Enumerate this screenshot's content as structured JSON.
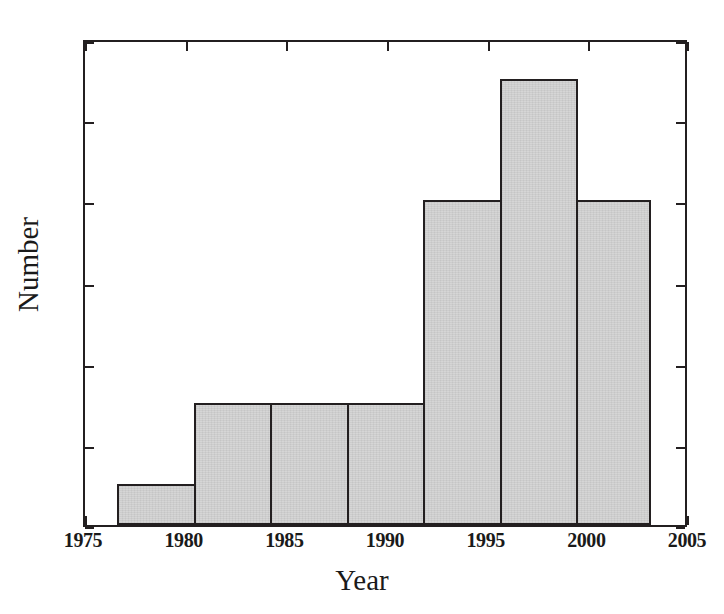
{
  "chart_data": {
    "type": "bar",
    "title": "",
    "xlabel": "Year",
    "ylabel": "Number",
    "xlim": [
      1975,
      2005
    ],
    "ylim": [
      0,
      12
    ],
    "grid": false,
    "legend": null,
    "xticks": [
      "1975",
      "1980",
      "1985",
      "1990",
      "1995",
      "2000",
      "2005"
    ],
    "xtick_values": [
      1975,
      1980,
      1985,
      1990,
      1995,
      2000,
      2005
    ],
    "yticks": [
      "0",
      "2",
      "4",
      "6",
      "8",
      "10",
      "12"
    ],
    "ytick_values": [
      0,
      2,
      4,
      6,
      8,
      10,
      12
    ],
    "bin_edges": [
      1976.6,
      1980.4,
      1984.2,
      1988.0,
      1991.8,
      1995.6,
      1999.4,
      2003.0
    ],
    "categories": [
      "1976.6-1980.4",
      "1980.4-1984.2",
      "1984.2-1988.0",
      "1988.0-1991.8",
      "1991.8-1995.6",
      "1995.6-1999.4",
      "1999.4-2003.0"
    ],
    "values": [
      1,
      3,
      3,
      3,
      8,
      11,
      8
    ],
    "bar_color": "#d3d3d3",
    "bar_edge_color": "#231f20",
    "axis_color": "#231f20",
    "background": "#ffffff"
  },
  "axes": {
    "x_title": "Year",
    "y_title": "Number"
  }
}
